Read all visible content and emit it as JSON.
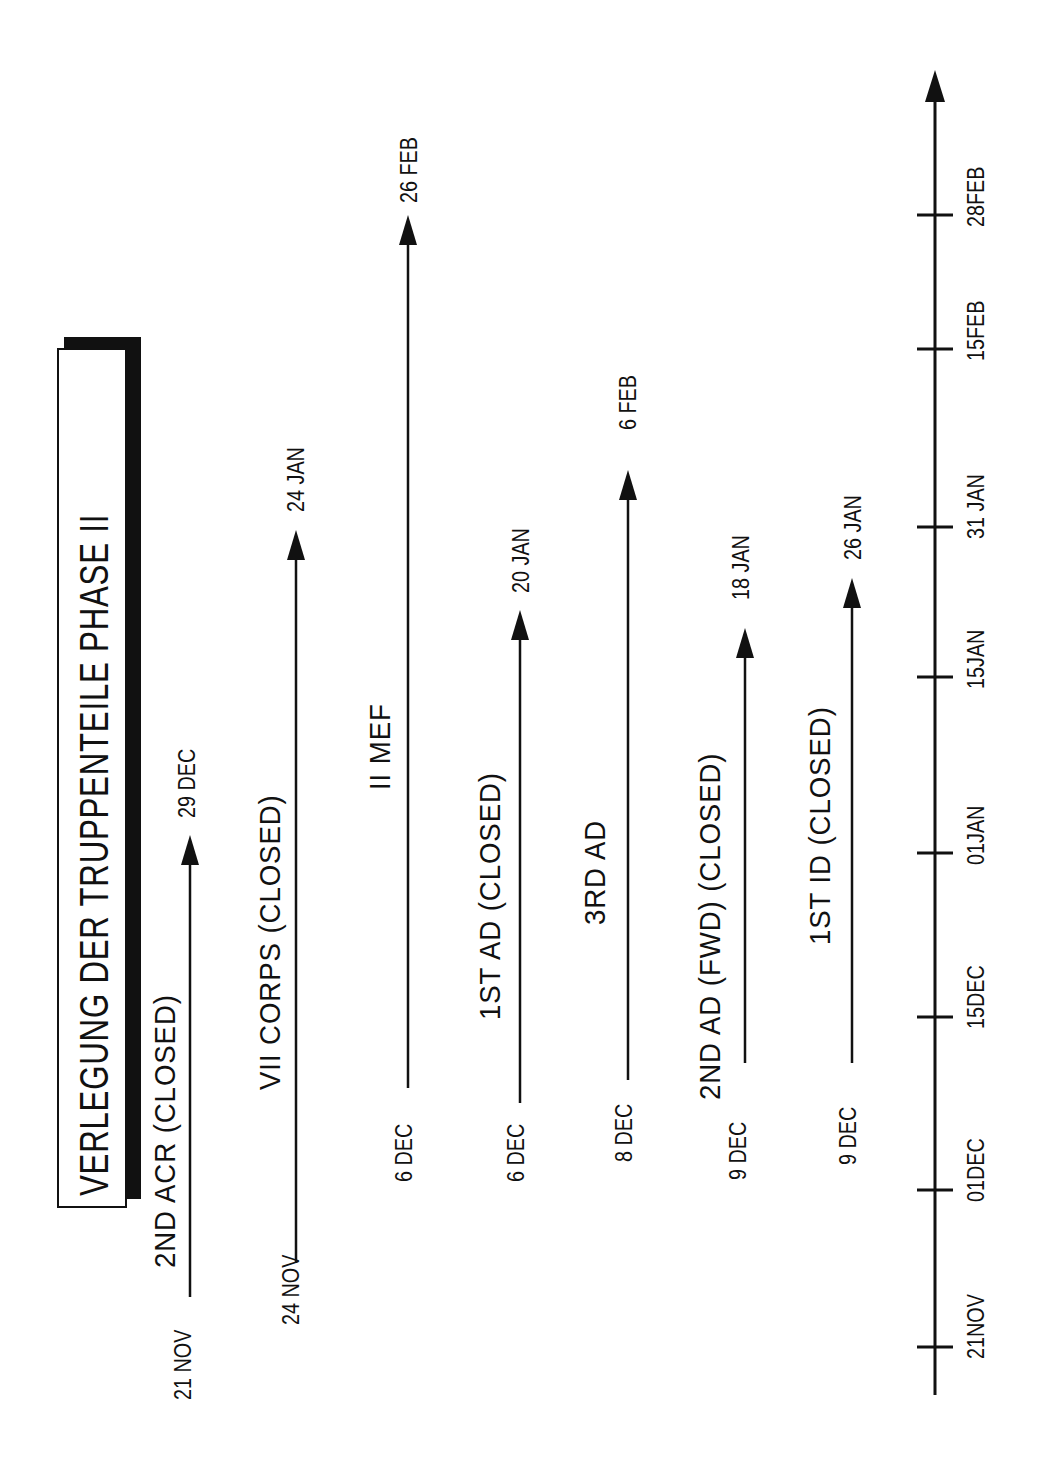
{
  "chart_data": {
    "type": "timeline",
    "title": "VERLEGUNG DER TRUPPENTEILE  PHASE II",
    "orientation": "rotated-90-ccw",
    "axis": {
      "ticks": [
        {
          "label": "21NOV",
          "y": 1347
        },
        {
          "label": "01DEC",
          "y": 1190
        },
        {
          "label": "15DEC",
          "y": 1017
        },
        {
          "label": "01JAN",
          "y": 853
        },
        {
          "label": "15JAN",
          "y": 677
        },
        {
          "label": "31 JAN",
          "y": 527
        },
        {
          "label": "15FEB",
          "y": 349
        },
        {
          "label": "28FEB",
          "y": 215
        }
      ],
      "x": 935,
      "y_bottom": 1395,
      "y_arrow_tip": 70
    },
    "series": [
      {
        "name": "2ND ACR (CLOSED)",
        "start": "21 NOV",
        "end": "29 DEC",
        "x": 190,
        "y_start": 1297,
        "y_end": 835,
        "label_pos": {
          "x": 150,
          "y": 1268
        },
        "start_pos": {
          "x": 172,
          "y": 1400
        },
        "end_pos": {
          "x": 176,
          "y": 818
        }
      },
      {
        "name": "VII CORPS (CLOSED)",
        "start": "24 NOV",
        "end": "24 JAN",
        "x": 296,
        "y_start": 1263,
        "y_end": 530,
        "label_pos": {
          "x": 255,
          "y": 1090
        },
        "start_pos": {
          "x": 280,
          "y": 1325
        },
        "end_pos": {
          "x": 285,
          "y": 512
        }
      },
      {
        "name": "II MEF",
        "start": "6 DEC",
        "end": "26 FEB",
        "x": 408,
        "y_start": 1088,
        "y_end": 215,
        "label_pos": {
          "x": 365,
          "y": 790
        },
        "start_pos": {
          "x": 393,
          "y": 1182
        },
        "end_pos": {
          "x": 398,
          "y": 203
        }
      },
      {
        "name": "1ST AD (CLOSED)",
        "start": "6 DEC",
        "end": "20 JAN",
        "x": 520,
        "y_start": 1103,
        "y_end": 610,
        "label_pos": {
          "x": 475,
          "y": 1020
        },
        "start_pos": {
          "x": 505,
          "y": 1182
        },
        "end_pos": {
          "x": 510,
          "y": 593
        }
      },
      {
        "name": "3RD AD",
        "start": "8 DEC",
        "end": "6 FEB",
        "x": 628,
        "y_start": 1080,
        "y_end": 470,
        "label_pos": {
          "x": 580,
          "y": 925
        },
        "start_pos": {
          "x": 613,
          "y": 1162
        },
        "end_pos": {
          "x": 617,
          "y": 430
        }
      },
      {
        "name": "2ND AD (FWD) (CLOSED)",
        "start": "9 DEC",
        "end": "18 JAN",
        "x": 745,
        "y_start": 1063,
        "y_end": 628,
        "label_pos": {
          "x": 695,
          "y": 1100
        },
        "start_pos": {
          "x": 727,
          "y": 1180
        },
        "end_pos": {
          "x": 730,
          "y": 600
        }
      },
      {
        "name": "1ST ID (CLOSED)",
        "start": "9 DEC",
        "end": "26 JAN",
        "x": 852,
        "y_start": 1063,
        "y_end": 578,
        "label_pos": {
          "x": 805,
          "y": 945
        },
        "start_pos": {
          "x": 837,
          "y": 1165
        },
        "end_pos": {
          "x": 842,
          "y": 560
        }
      }
    ],
    "xlabel": "",
    "ylabel": "",
    "grid": false,
    "legend": "none"
  }
}
